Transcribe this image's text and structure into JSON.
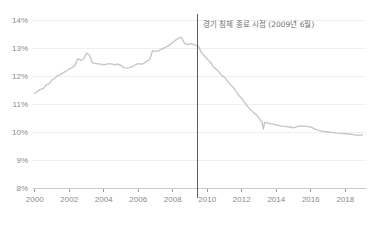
{
  "chart_data": {
    "type": "line",
    "title": "",
    "subtitle": "",
    "xlabel": "",
    "ylabel": "",
    "xlim": [
      1999.9,
      2019.2
    ],
    "ylim": [
      8,
      14
    ],
    "grid": true,
    "legend": null,
    "line_color": "#c8c8c8",
    "event_line_color": "#5a5a5a",
    "axis_text_color": "#8a8a8a",
    "gridline_color": "#efefef",
    "y_ticks": [
      8,
      9,
      10,
      11,
      12,
      13,
      14
    ],
    "y_tick_labels": [
      "8%",
      "9%",
      "10%",
      "11%",
      "12%",
      "13%",
      "14%"
    ],
    "x_ticks": [
      2000,
      2002,
      2004,
      2006,
      2008,
      2010,
      2012,
      2014,
      2016,
      2018
    ],
    "x_tick_labels": [
      "2000",
      "2002",
      "2004",
      "2006",
      "2008",
      "2010",
      "2012",
      "2014",
      "2016",
      "2018"
    ],
    "annotations": [
      {
        "name": "recession-end-marker",
        "text": "경기 침체 종료 시점 (2009년 6월)",
        "x": 2009.45,
        "type": "vertical-line-with-label"
      }
    ],
    "series": [
      {
        "name": "rate",
        "color": "#c8c8c8",
        "x": [
          2000.0,
          2000.17,
          2000.33,
          2000.5,
          2000.67,
          2000.83,
          2001.0,
          2001.17,
          2001.33,
          2001.5,
          2001.67,
          2001.83,
          2002.0,
          2002.17,
          2002.33,
          2002.5,
          2002.67,
          2002.83,
          2003.0,
          2003.17,
          2003.33,
          2003.5,
          2003.67,
          2003.83,
          2004.0,
          2004.17,
          2004.33,
          2004.5,
          2004.67,
          2004.83,
          2005.0,
          2005.17,
          2005.33,
          2005.5,
          2005.67,
          2005.83,
          2006.0,
          2006.17,
          2006.33,
          2006.5,
          2006.67,
          2006.83,
          2007.0,
          2007.17,
          2007.33,
          2007.5,
          2007.67,
          2007.83,
          2008.0,
          2008.17,
          2008.33,
          2008.5,
          2008.67,
          2008.83,
          2009.0,
          2009.17,
          2009.33,
          2009.5,
          2009.67,
          2009.83,
          2010.0,
          2010.17,
          2010.33,
          2010.5,
          2010.67,
          2010.83,
          2011.0,
          2011.17,
          2011.33,
          2011.5,
          2011.67,
          2011.83,
          2012.0,
          2012.17,
          2012.33,
          2012.5,
          2012.67,
          2012.83,
          2013.0,
          2013.08,
          2013.17,
          2013.25,
          2013.33,
          2013.5,
          2013.67,
          2013.83,
          2014.0,
          2014.25,
          2014.5,
          2014.75,
          2015.0,
          2015.25,
          2015.5,
          2015.75,
          2016.0,
          2016.25,
          2016.5,
          2016.75,
          2017.0,
          2017.25,
          2017.5,
          2017.75,
          2018.0,
          2018.25,
          2018.5,
          2018.75,
          2019.0
        ],
        "y": [
          11.38,
          11.45,
          11.52,
          11.55,
          11.68,
          11.72,
          11.86,
          11.92,
          12.02,
          12.05,
          12.12,
          12.18,
          12.25,
          12.3,
          12.38,
          12.62,
          12.56,
          12.6,
          12.82,
          12.75,
          12.48,
          12.45,
          12.44,
          12.42,
          12.4,
          12.42,
          12.44,
          12.42,
          12.4,
          12.42,
          12.38,
          12.3,
          12.28,
          12.3,
          12.34,
          12.4,
          12.44,
          12.42,
          12.46,
          12.52,
          12.6,
          12.9,
          12.88,
          12.9,
          12.95,
          13.0,
          13.05,
          13.12,
          13.2,
          13.28,
          13.35,
          13.38,
          13.18,
          13.12,
          13.15,
          13.14,
          13.1,
          13.05,
          12.82,
          12.72,
          12.6,
          12.5,
          12.35,
          12.25,
          12.15,
          12.02,
          11.95,
          11.82,
          11.7,
          11.6,
          11.45,
          11.3,
          11.2,
          11.05,
          10.92,
          10.8,
          10.7,
          10.62,
          10.5,
          10.42,
          10.38,
          10.1,
          10.35,
          10.32,
          10.3,
          10.28,
          10.25,
          10.22,
          10.2,
          10.18,
          10.15,
          10.2,
          10.22,
          10.2,
          10.18,
          10.1,
          10.05,
          10.02,
          10.0,
          9.98,
          9.96,
          9.95,
          9.94,
          9.93,
          9.9,
          9.88,
          9.9
        ]
      }
    ]
  }
}
